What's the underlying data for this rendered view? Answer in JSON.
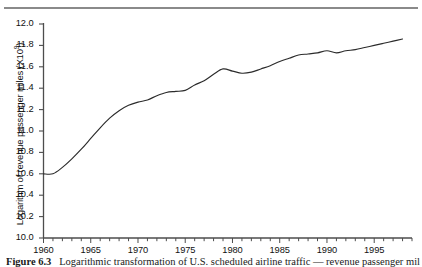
{
  "figure": {
    "caption_label": "Figure 6.3",
    "caption_text": "Logarithmic transformation of U.S. scheduled airline traffic — revenue passenger miles"
  },
  "axes": {
    "y_title": "Logarithm of revenue passenger miles (X10",
    "y_title_sup": "9",
    "y_title_close": ")",
    "y_ticks": [
      "12.0",
      "11.8",
      "11.6",
      "11.4",
      "11.2",
      "11.0",
      "10.8",
      "10.6",
      "10.4",
      "10.2",
      "10.0"
    ],
    "x_ticks": [
      "1960",
      "1965",
      "1970",
      "1975",
      "1980",
      "1985",
      "1990",
      "1995"
    ]
  },
  "colors": {
    "line": "#2b2b2b",
    "axis": "#4d4d4d",
    "rule": "#8a8a8a",
    "text": "#111111"
  },
  "chart_data": {
    "type": "line",
    "title": "",
    "xlabel": "",
    "ylabel": "Logarithm of revenue passenger miles (X10^9)",
    "xlim": [
      1960,
      1999
    ],
    "ylim": [
      10.0,
      12.0
    ],
    "grid": false,
    "legend": "none",
    "x_major_ticks": [
      1960,
      1965,
      1970,
      1975,
      1980,
      1985,
      1990,
      1995
    ],
    "x_minor_tick_interval": 1,
    "y_tick_interval": 0.2,
    "x": [
      1960,
      1961,
      1962,
      1963,
      1964,
      1965,
      1966,
      1967,
      1968,
      1969,
      1970,
      1971,
      1972,
      1973,
      1974,
      1975,
      1976,
      1977,
      1978,
      1979,
      1980,
      1981,
      1982,
      1983,
      1984,
      1985,
      1986,
      1987,
      1988,
      1989,
      1990,
      1991,
      1992,
      1993,
      1994,
      1995,
      1996,
      1997,
      1998
    ],
    "series": [
      {
        "name": "Log revenue passenger miles",
        "values": [
          10.6,
          10.6,
          10.66,
          10.74,
          10.83,
          10.93,
          11.03,
          11.12,
          11.19,
          11.24,
          11.27,
          11.29,
          11.33,
          11.36,
          11.37,
          11.38,
          11.43,
          11.47,
          11.53,
          11.58,
          11.56,
          11.54,
          11.55,
          11.58,
          11.61,
          11.65,
          11.68,
          11.71,
          11.72,
          11.73,
          11.75,
          11.73,
          11.75,
          11.76,
          11.78,
          11.8,
          11.82,
          11.84,
          11.86
        ]
      }
    ]
  }
}
